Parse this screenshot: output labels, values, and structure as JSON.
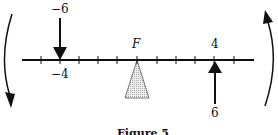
{
  "figure": {
    "caption": "Figure 5",
    "fulcrum_label": "F",
    "left_force": {
      "magnitude_label": "−6",
      "position_label": "−4",
      "direction": "down"
    },
    "right_force": {
      "magnitude_label": "6",
      "position_label": "4",
      "direction": "up"
    },
    "rotation_arrows": [
      "counterclockwise-left",
      "clockwise-right"
    ],
    "colors": {
      "line": "#111111",
      "fulcrum_fill": "#d9d9d9"
    }
  }
}
